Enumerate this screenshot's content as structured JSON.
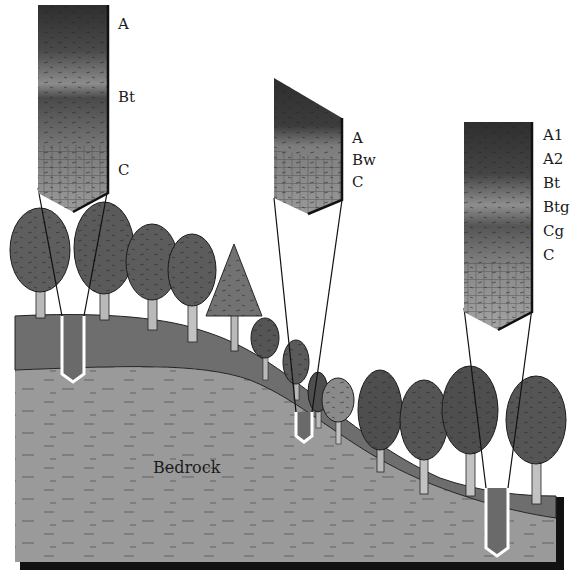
{
  "diagram": {
    "colors": {
      "background": "#ffffff",
      "bedrock": "#9a9a9a",
      "soil": "#6e6e6e",
      "profile_dark": "#3a3a3a",
      "profile_mid": "#8a8a8a",
      "profile_light": "#a8a8a8",
      "outline": "#111111",
      "tree_dark": "#2b2b2b",
      "tree_mid": "#6a6a6a",
      "trunk": "#b9b9b9"
    },
    "bedrock_label": "Bedrock",
    "profiles": [
      {
        "id": "summit",
        "position": "hilltop (left)",
        "horizons": [
          "A",
          "Bt",
          "C"
        ]
      },
      {
        "id": "backslope",
        "position": "midslope (center)",
        "horizons": [
          "A",
          "Bw",
          "C"
        ]
      },
      {
        "id": "toeslope",
        "position": "valley bottom (right)",
        "horizons": [
          "A1",
          "A2",
          "Bt",
          "Btg",
          "Cg",
          "C"
        ]
      }
    ]
  }
}
